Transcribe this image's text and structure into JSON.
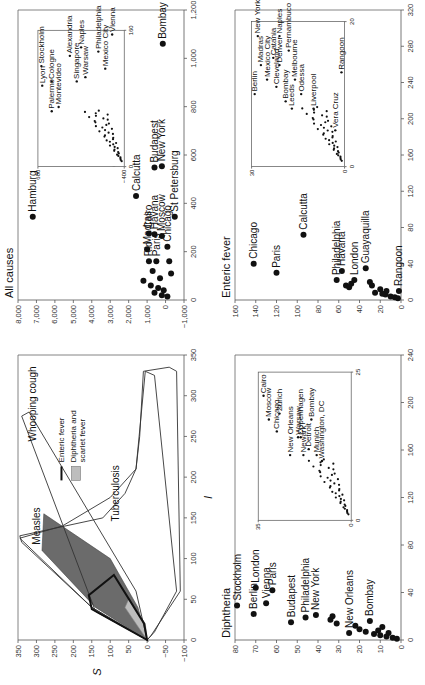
{
  "figure": {
    "orientation": "rotated-90-ccw",
    "panels": [
      "envelope",
      "all_causes",
      "diphtheria",
      "enteric_fever"
    ]
  },
  "chart_data": [
    {
      "id": "envelope",
      "type": "area",
      "title": "",
      "xlabel": "I",
      "ylabel": "S",
      "xlim": [
        0,
        350
      ],
      "ylim": [
        -100,
        350
      ],
      "xticks": [
        0,
        50,
        100,
        150,
        200,
        250,
        300,
        350
      ],
      "yticks": [
        -100,
        -50,
        0,
        50,
        100,
        150,
        200,
        250,
        300,
        350
      ],
      "regions": [
        {
          "name": "Measles",
          "style": "outline",
          "points": [
            [
              0,
              0
            ],
            [
              40,
              150
            ],
            [
              125,
              345
            ],
            [
              140,
              230
            ],
            [
              175,
              100
            ],
            [
              210,
              30
            ],
            [
              330,
              5
            ],
            [
              325,
              -20
            ],
            [
              60,
              -80
            ],
            [
              10,
              -20
            ],
            [
              0,
              0
            ]
          ]
        },
        {
          "name": "Whooping cough",
          "style": "outline",
          "points": [
            [
              0,
              0
            ],
            [
              35,
              140
            ],
            [
              275,
              340
            ],
            [
              280,
              320
            ],
            [
              60,
              30
            ],
            [
              0,
              0
            ]
          ]
        },
        {
          "name": "Tuberculosis",
          "style": "outline",
          "points": [
            [
              0,
              0
            ],
            [
              5,
              -10
            ],
            [
              60,
              -90
            ],
            [
              330,
              -80
            ],
            [
              335,
              -60
            ],
            [
              330,
              10
            ],
            [
              250,
              20
            ],
            [
              210,
              30
            ],
            [
              180,
              60
            ],
            [
              150,
              120
            ],
            [
              128,
              345
            ],
            [
              120,
              340
            ],
            [
              40,
              150
            ],
            [
              0,
              0
            ]
          ]
        },
        {
          "name": "Measles-dark",
          "style": "fill-dark",
          "points": [
            [
              0,
              0
            ],
            [
              40,
              140
            ],
            [
              110,
              285
            ],
            [
              155,
              280
            ],
            [
              100,
              100
            ],
            [
              40,
              25
            ],
            [
              0,
              0
            ]
          ]
        },
        {
          "name": "Diphtheria and scarlet fever",
          "style": "fill-light",
          "points": [
            [
              0,
              0
            ],
            [
              40,
              60
            ],
            [
              50,
              50
            ],
            [
              20,
              5
            ],
            [
              0,
              0
            ]
          ]
        },
        {
          "name": "Enteric fever",
          "style": "bold-outline",
          "points": [
            [
              0,
              0
            ],
            [
              38,
              150
            ],
            [
              55,
              158
            ],
            [
              80,
              90
            ],
            [
              20,
              8
            ],
            [
              0,
              0
            ]
          ]
        }
      ],
      "region_labels": [
        {
          "text": "Measles",
          "x": 140,
          "y": 290
        },
        {
          "text": "Whooping cough",
          "x": 290,
          "y": 300
        },
        {
          "text": "Tuberculosis",
          "x": 180,
          "y": 75
        },
        {
          "text": "Enteric fever",
          "legend": "line"
        },
        {
          "text": "Diphtheria and scarlet fever",
          "legend": "fill"
        }
      ],
      "legend": {
        "position": "top-right",
        "entries": [
          {
            "label": "Enteric fever",
            "marker": "line"
          },
          {
            "label": "Diphtheria and",
            "label2": "scarlet fever",
            "marker": "fill"
          }
        ]
      }
    },
    {
      "id": "all_causes",
      "type": "scatter",
      "title": "All causes",
      "xlabel": "",
      "ylabel": "",
      "xlim": [
        0,
        1200
      ],
      "ylim": [
        -1000,
        8000
      ],
      "xticks": [
        0,
        200,
        400,
        600,
        800,
        1000,
        1200
      ],
      "yticks": [
        -1000,
        0,
        1000,
        2000,
        3000,
        4000,
        5000,
        6000,
        7000,
        8000
      ],
      "points": [
        {
          "label": "Hamburg",
          "x": 345,
          "y": 7200
        },
        {
          "label": "Bombay",
          "x": 1060,
          "y": 150
        },
        {
          "label": "London",
          "x": 565,
          "y": 2800
        },
        {
          "label": "Calcutta",
          "x": 430,
          "y": 1600
        },
        {
          "label": "Budapest",
          "x": 548,
          "y": 600
        },
        {
          "label": "New York",
          "x": 553,
          "y": 200
        },
        {
          "label": "St Petersburg",
          "x": 345,
          "y": -500
        },
        {
          "label": "Madras",
          "x": 210,
          "y": 1000
        },
        {
          "label": "Cairo",
          "x": 275,
          "y": 900
        },
        {
          "label": "Havana",
          "x": 272,
          "y": 600
        },
        {
          "label": "Moscow",
          "x": 265,
          "y": 200
        },
        {
          "label": "Chicago",
          "x": 220,
          "y": -100
        },
        {
          "label": "Rio",
          "x": 160,
          "y": 900
        },
        {
          "label": "Paris",
          "x": 160,
          "y": 500
        },
        {
          "label": "",
          "x": 120,
          "y": 700
        },
        {
          "label": "",
          "x": 90,
          "y": 300
        },
        {
          "label": "",
          "x": 80,
          "y": 1200
        },
        {
          "label": "",
          "x": 60,
          "y": 800
        },
        {
          "label": "",
          "x": 50,
          "y": 400
        },
        {
          "label": "",
          "x": 40,
          "y": 100
        },
        {
          "label": "",
          "x": 30,
          "y": 600
        },
        {
          "label": "",
          "x": 20,
          "y": 200
        },
        {
          "label": "",
          "x": 15,
          "y": -100
        },
        {
          "label": "",
          "x": 110,
          "y": -300
        },
        {
          "label": "",
          "x": 160,
          "y": -200
        }
      ],
      "inset": {
        "xlim": [
          0,
          160
        ],
        "ylim": [
          -400,
          600
        ],
        "xticks": [
          0,
          160
        ],
        "yticks": [
          -400,
          600
        ],
        "points": [
          {
            "label": "Lyon",
            "x": 95,
            "y": 550
          },
          {
            "label": "Stockholm",
            "x": 118,
            "y": 560
          },
          {
            "label": "Palermo",
            "x": 65,
            "y": 440
          },
          {
            "label": "Cologne",
            "x": 100,
            "y": 440
          },
          {
            "label": "Montevideo",
            "x": 70,
            "y": 360
          },
          {
            "label": "Alexandria",
            "x": 130,
            "y": 230
          },
          {
            "label": "Singapore",
            "x": 100,
            "y": 150
          },
          {
            "label": "Naples",
            "x": 140,
            "y": 100
          },
          {
            "label": "Warsaw",
            "x": 105,
            "y": 50
          },
          {
            "label": "Philadelphia",
            "x": 135,
            "y": -100
          },
          {
            "label": "Mexico City",
            "x": 115,
            "y": -180
          },
          {
            "label": "Vienna",
            "x": 155,
            "y": -260
          }
        ]
      }
    },
    {
      "id": "diphtheria",
      "type": "scatter",
      "title": "Diphtheria",
      "xlabel": "",
      "ylabel": "",
      "xlim": [
        0,
        240
      ],
      "ylim": [
        0,
        80
      ],
      "xticks": [
        0,
        40,
        80,
        120,
        160,
        200,
        240
      ],
      "yticks": [
        0,
        10,
        20,
        30,
        40,
        50,
        60,
        70,
        80
      ],
      "points": [
        {
          "label": "Berlin",
          "x": 22,
          "y": 71
        },
        {
          "label": "Stockholm",
          "x": 29,
          "y": 79
        },
        {
          "label": "London",
          "x": 44,
          "y": 70
        },
        {
          "label": "Vienna",
          "x": 31,
          "y": 65
        },
        {
          "label": "Paris",
          "x": 42,
          "y": 62
        },
        {
          "label": "Budapest",
          "x": 15,
          "y": 53
        },
        {
          "label": "Philadelphia",
          "x": 19,
          "y": 46
        },
        {
          "label": "New York",
          "x": 21,
          "y": 41
        },
        {
          "label": "New Orleans",
          "x": 6,
          "y": 25
        },
        {
          "label": "Bombay",
          "x": 16,
          "y": 15
        },
        {
          "label": "",
          "x": 17,
          "y": 34
        },
        {
          "label": "",
          "x": 14,
          "y": 31
        },
        {
          "label": "",
          "x": 20,
          "y": 33
        },
        {
          "label": "",
          "x": 12,
          "y": 22
        },
        {
          "label": "",
          "x": 9,
          "y": 20
        },
        {
          "label": "",
          "x": 7,
          "y": 17
        },
        {
          "label": "",
          "x": 5,
          "y": 13
        },
        {
          "label": "",
          "x": 4,
          "y": 10
        },
        {
          "label": "",
          "x": 3,
          "y": 7
        },
        {
          "label": "",
          "x": 2,
          "y": 4
        },
        {
          "label": "",
          "x": 1,
          "y": 2
        },
        {
          "label": "",
          "x": 8,
          "y": 11
        },
        {
          "label": "",
          "x": 11,
          "y": 9
        },
        {
          "label": "",
          "x": 6,
          "y": 6
        }
      ],
      "inset": {
        "xlim": [
          0,
          25
        ],
        "ylim": [
          0,
          35
        ],
        "xticks": [
          0,
          25
        ],
        "yticks": [
          0,
          35
        ],
        "points": [
          {
            "label": "Moscow",
            "x": 17,
            "y": 31
          },
          {
            "label": "Chicago",
            "x": 15,
            "y": 28
          },
          {
            "label": "New Orleans",
            "x": 11,
            "y": 23
          },
          {
            "label": "Cairo",
            "x": 21,
            "y": 33
          },
          {
            "label": "Zurich",
            "x": 18,
            "y": 27
          },
          {
            "label": "Warsaw",
            "x": 14,
            "y": 20
          },
          {
            "label": "Copenhagen",
            "x": 14,
            "y": 19
          },
          {
            "label": "Bombay",
            "x": 17,
            "y": 15
          },
          {
            "label": "Newark",
            "x": 11,
            "y": 18
          },
          {
            "label": "Detroit",
            "x": 12,
            "y": 16
          },
          {
            "label": "Munich",
            "x": 11,
            "y": 13
          },
          {
            "label": "Washington, DC",
            "x": 10,
            "y": 11
          }
        ]
      }
    },
    {
      "id": "enteric_fever",
      "type": "scatter",
      "title": "Enteric fever",
      "xlabel": "",
      "ylabel": "",
      "xlim": [
        0,
        320
      ],
      "ylim": [
        0,
        160
      ],
      "xticks": [
        0,
        40,
        80,
        120,
        160,
        200,
        240,
        280,
        320
      ],
      "yticks": [
        0,
        20,
        40,
        60,
        80,
        100,
        120,
        140,
        160
      ],
      "points": [
        {
          "label": "Chicago",
          "x": 40,
          "y": 142
        },
        {
          "label": "Paris",
          "x": 30,
          "y": 120
        },
        {
          "label": "Calcutta",
          "x": 72,
          "y": 94
        },
        {
          "label": "Philadelphia",
          "x": 22,
          "y": 62
        },
        {
          "label": "Havana",
          "x": 32,
          "y": 57
        },
        {
          "label": "London",
          "x": 22,
          "y": 45
        },
        {
          "label": "Guayaquilla",
          "x": 35,
          "y": 34
        },
        {
          "label": "Rangoon",
          "x": 10,
          "y": 2
        },
        {
          "label": "",
          "x": 16,
          "y": 53
        },
        {
          "label": "",
          "x": 14,
          "y": 50
        },
        {
          "label": "",
          "x": 18,
          "y": 48
        },
        {
          "label": "",
          "x": 20,
          "y": 30
        },
        {
          "label": "",
          "x": 16,
          "y": 28
        },
        {
          "label": "",
          "x": 8,
          "y": 25
        },
        {
          "label": "",
          "x": 12,
          "y": 20
        },
        {
          "label": "",
          "x": 6,
          "y": 15
        },
        {
          "label": "",
          "x": 4,
          "y": 10
        },
        {
          "label": "",
          "x": 3,
          "y": 6
        },
        {
          "label": "",
          "x": 2,
          "y": 3
        },
        {
          "label": "",
          "x": 10,
          "y": 14
        },
        {
          "label": "",
          "x": 7,
          "y": 18
        }
      ],
      "inset": {
        "xlim": [
          0,
          20
        ],
        "ylim": [
          0,
          30
        ],
        "xticks": [
          0,
          20
        ],
        "yticks": [
          0,
          30
        ],
        "points": [
          {
            "label": "Berlin",
            "x": 10,
            "y": 29
          },
          {
            "label": "Madras",
            "x": 14,
            "y": 27
          },
          {
            "label": "New York",
            "x": 18,
            "y": 28
          },
          {
            "label": "Mexico City",
            "x": 12,
            "y": 25
          },
          {
            "label": "Catania",
            "x": 15,
            "y": 23
          },
          {
            "label": "Cleveland",
            "x": 11,
            "y": 22
          },
          {
            "label": "Denver",
            "x": 14,
            "y": 21
          },
          {
            "label": "Naples",
            "x": 18,
            "y": 21
          },
          {
            "label": "Pernambuco",
            "x": 16,
            "y": 18
          },
          {
            "label": "Bombay",
            "x": 9,
            "y": 19
          },
          {
            "label": "Leeds",
            "x": 8,
            "y": 17
          },
          {
            "label": "Melbourne",
            "x": 12,
            "y": 16
          },
          {
            "label": "Odessa",
            "x": 10,
            "y": 14
          },
          {
            "label": "Liverpool",
            "x": 8,
            "y": 10
          },
          {
            "label": "Vera Cruz",
            "x": 5,
            "y": 3
          },
          {
            "label": "Rangoon",
            "x": 13,
            "y": 1
          }
        ]
      }
    }
  ]
}
